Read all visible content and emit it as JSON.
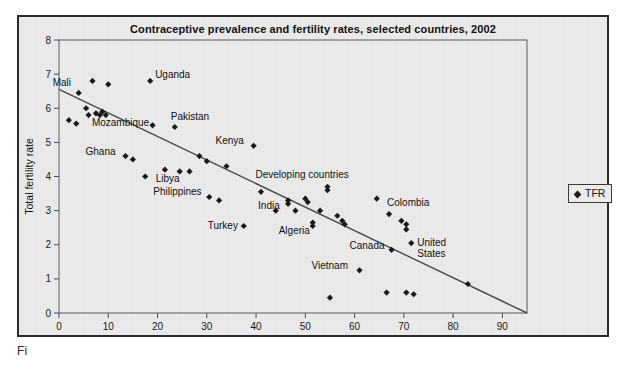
{
  "figure": {
    "title": "Contraceptive prevalence and fertility rates, selected countries, 2002",
    "bottom_caption": "Fi",
    "panel_bg": "#ebebeb",
    "border_color": "#2b2b2b",
    "marker_color": "#1a1a1a",
    "line_color": "#4a4a4a"
  },
  "legend": {
    "position": "right",
    "entries": [
      {
        "label": "TFR",
        "marker": "diamond-marker",
        "color": "#1a1a1a"
      }
    ]
  },
  "chart_data": {
    "type": "scatter",
    "title": "Contraceptive prevalence and fertility rates, selected countries, 2002",
    "xlabel": "Percent using modern contraceptives",
    "ylabel": "Total fertility rate",
    "xlim": [
      0,
      95
    ],
    "ylim": [
      0,
      8
    ],
    "xticks": [
      0,
      10,
      20,
      30,
      40,
      50,
      60,
      70,
      80,
      90
    ],
    "yticks": [
      0,
      1,
      2,
      3,
      4,
      5,
      6,
      7,
      8
    ],
    "grid": false,
    "legend_position": "right-outside",
    "series": [
      {
        "name": "TFR",
        "marker": "diamond",
        "color": "#1a1a1a",
        "points": [
          {
            "x": 2.0,
            "y": 5.65,
            "label": ""
          },
          {
            "x": 3.5,
            "y": 5.55,
            "label": ""
          },
          {
            "x": 4.0,
            "y": 6.45,
            "label": "Mali"
          },
          {
            "x": 5.5,
            "y": 6.0,
            "label": ""
          },
          {
            "x": 6.0,
            "y": 5.8,
            "label": ""
          },
          {
            "x": 6.8,
            "y": 6.8,
            "label": ""
          },
          {
            "x": 7.5,
            "y": 5.85,
            "label": ""
          },
          {
            "x": 8.3,
            "y": 5.8,
            "label": "Mozambique"
          },
          {
            "x": 8.8,
            "y": 5.9,
            "label": ""
          },
          {
            "x": 9.5,
            "y": 5.8,
            "label": ""
          },
          {
            "x": 10.0,
            "y": 6.7,
            "label": ""
          },
          {
            "x": 13.5,
            "y": 4.6,
            "label": "Ghana"
          },
          {
            "x": 15.0,
            "y": 4.5,
            "label": ""
          },
          {
            "x": 17.5,
            "y": 4.0,
            "label": ""
          },
          {
            "x": 18.5,
            "y": 6.8,
            "label": "Uganda"
          },
          {
            "x": 19.0,
            "y": 5.5,
            "label": ""
          },
          {
            "x": 21.5,
            "y": 4.2,
            "label": ""
          },
          {
            "x": 23.5,
            "y": 5.45,
            "label": "Pakistan"
          },
          {
            "x": 24.5,
            "y": 4.15,
            "label": "Libya"
          },
          {
            "x": 26.5,
            "y": 4.15,
            "label": ""
          },
          {
            "x": 28.5,
            "y": 4.6,
            "label": ""
          },
          {
            "x": 30.0,
            "y": 4.45,
            "label": ""
          },
          {
            "x": 30.5,
            "y": 3.4,
            "label": "Philippines"
          },
          {
            "x": 32.5,
            "y": 3.3,
            "label": ""
          },
          {
            "x": 34.0,
            "y": 4.3,
            "label": ""
          },
          {
            "x": 37.5,
            "y": 2.55,
            "label": "Turkey"
          },
          {
            "x": 39.5,
            "y": 4.9,
            "label": "Kenya"
          },
          {
            "x": 41.0,
            "y": 3.55,
            "label": ""
          },
          {
            "x": 44.0,
            "y": 3.0,
            "label": ""
          },
          {
            "x": 46.5,
            "y": 3.3,
            "label": "India"
          },
          {
            "x": 46.5,
            "y": 3.2,
            "label": ""
          },
          {
            "x": 48.0,
            "y": 3.0,
            "label": ""
          },
          {
            "x": 50.0,
            "y": 3.35,
            "label": ""
          },
          {
            "x": 50.5,
            "y": 3.25,
            "label": ""
          },
          {
            "x": 51.5,
            "y": 2.65,
            "label": "Algeria"
          },
          {
            "x": 51.5,
            "y": 2.55,
            "label": ""
          },
          {
            "x": 53.0,
            "y": 3.0,
            "label": ""
          },
          {
            "x": 54.5,
            "y": 3.7,
            "label": "Developing countries"
          },
          {
            "x": 54.5,
            "y": 3.6,
            "label": ""
          },
          {
            "x": 55.0,
            "y": 0.45,
            "label": ""
          },
          {
            "x": 56.5,
            "y": 2.85,
            "label": ""
          },
          {
            "x": 57.5,
            "y": 2.7,
            "label": ""
          },
          {
            "x": 58.0,
            "y": 2.6,
            "label": ""
          },
          {
            "x": 61.0,
            "y": 1.25,
            "label": "Vietnam"
          },
          {
            "x": 64.5,
            "y": 3.35,
            "label": ""
          },
          {
            "x": 66.5,
            "y": 0.6,
            "label": ""
          },
          {
            "x": 67.0,
            "y": 2.9,
            "label": "Colombia"
          },
          {
            "x": 67.5,
            "y": 1.85,
            "label": "Canada"
          },
          {
            "x": 69.5,
            "y": 2.7,
            "label": ""
          },
          {
            "x": 70.5,
            "y": 2.6,
            "label": ""
          },
          {
            "x": 70.5,
            "y": 2.45,
            "label": ""
          },
          {
            "x": 70.5,
            "y": 0.6,
            "label": ""
          },
          {
            "x": 71.5,
            "y": 2.05,
            "label": "United\nStates"
          },
          {
            "x": 72.0,
            "y": 0.55,
            "label": ""
          },
          {
            "x": 83.0,
            "y": 0.85,
            "label": ""
          }
        ]
      }
    ],
    "trendline": {
      "x0": 0,
      "y0": 6.55,
      "x1": 95,
      "y1": 0.0
    },
    "annotations": [
      {
        "text": "Mali",
        "x": 4.0,
        "y": 6.45,
        "dx": -26,
        "dy": -7
      },
      {
        "text": "Uganda",
        "x": 18.5,
        "y": 6.8,
        "dx": 5,
        "dy": -3
      },
      {
        "text": "Pakistan",
        "x": 23.5,
        "y": 5.45,
        "dx": -4,
        "dy": -7
      },
      {
        "text": "Mozambique",
        "x": 8.3,
        "y": 5.8,
        "dx": -8,
        "dy": 11
      },
      {
        "text": "Ghana",
        "x": 13.5,
        "y": 4.6,
        "dx": -40,
        "dy": -1
      },
      {
        "text": "Kenya",
        "x": 39.5,
        "y": 4.9,
        "dx": -38,
        "dy": -2
      },
      {
        "text": "Libya",
        "x": 24.5,
        "y": 4.15,
        "dx": -24,
        "dy": 11
      },
      {
        "text": "Philippines",
        "x": 30.5,
        "y": 3.4,
        "dx": -56,
        "dy": -2
      },
      {
        "text": "Developing countries",
        "x": 54.5,
        "y": 3.7,
        "dx": -72,
        "dy": -9
      },
      {
        "text": "India",
        "x": 46.5,
        "y": 3.3,
        "dx": -30,
        "dy": 9
      },
      {
        "text": "Algeria",
        "x": 51.5,
        "y": 2.65,
        "dx": -34,
        "dy": 11
      },
      {
        "text": "Turkey",
        "x": 37.5,
        "y": 2.55,
        "dx": -36,
        "dy": 3
      },
      {
        "text": "Colombia",
        "x": 67.0,
        "y": 2.9,
        "dx": -2,
        "dy": -8
      },
      {
        "text": "Canada",
        "x": 67.5,
        "y": 1.85,
        "dx": -42,
        "dy": -1
      },
      {
        "text": "United",
        "x": 71.5,
        "y": 2.05,
        "dx": 6,
        "dy": 3
      },
      {
        "text": "States",
        "x": 71.5,
        "y": 2.05,
        "dx": 6,
        "dy": 14
      },
      {
        "text": "Vietnam",
        "x": 61.0,
        "y": 1.25,
        "dx": -48,
        "dy": -1
      }
    ]
  }
}
